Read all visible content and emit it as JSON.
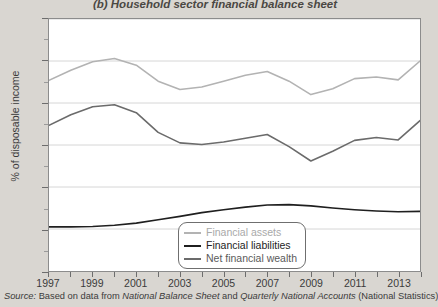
{
  "title": "(b) Household sector financial balance sheet",
  "axes": {
    "ylabel": "% of disposable income",
    "y_ticks": [
      0,
      100,
      200,
      300,
      400,
      500,
      600
    ],
    "y_minor_ticks": [
      50,
      150,
      250,
      350,
      450,
      550
    ],
    "x_ticks": [
      1997,
      1998,
      1999,
      2000,
      2001,
      2002,
      2003,
      2004,
      2005,
      2006,
      2007,
      2008,
      2009,
      2010,
      2011,
      2012,
      2013,
      2014
    ],
    "x_tick_labels": [
      "1997",
      "",
      "1999",
      "",
      "2001",
      "",
      "2003",
      "",
      "2005",
      "",
      "2007",
      "",
      "2009",
      "",
      "2011",
      "",
      "2013",
      ""
    ]
  },
  "legend": {
    "position": "bottom-center",
    "items": [
      {
        "label": "Financial assets",
        "color": "#b3b3b3"
      },
      {
        "label": "Financial liabilities",
        "color": "#1f1f1f"
      },
      {
        "label": "Net financial wealth",
        "color": "#6b6b6b"
      }
    ]
  },
  "source": {
    "lead": "Source:",
    "text_1": " Based on data from ",
    "italic_1": "National Balance Sheet",
    "text_2": " and ",
    "italic_2": "Quarterly National Accounts",
    "text_3": " (National Statistics)"
  },
  "colors": {
    "page_background": "#d9d6d1",
    "plot_background": "#ffffff",
    "gridline": "#d6d6d6",
    "axis": "#8c8c8c",
    "text": "#3b3b3b"
  },
  "chart_data": {
    "type": "line",
    "title": "(b) Household sector financial balance sheet",
    "xlabel": "",
    "ylabel": "% of disposable income",
    "xlim": [
      1997,
      2014
    ],
    "ylim": [
      0,
      600
    ],
    "grid": true,
    "legend_position": "bottom-center",
    "x": [
      1997,
      1998,
      1999,
      2000,
      2001,
      2002,
      2003,
      2004,
      2005,
      2006,
      2007,
      2008,
      2009,
      2010,
      2011,
      2012,
      2013,
      2014
    ],
    "series": [
      {
        "name": "Financial assets",
        "color": "#b3b3b3",
        "values": [
          454,
          478,
          498,
          506,
          490,
          452,
          432,
          438,
          452,
          466,
          475,
          452,
          420,
          434,
          458,
          462,
          455,
          500
        ]
      },
      {
        "name": "Financial liabilities",
        "color": "#1f1f1f",
        "values": [
          105,
          105,
          106,
          109,
          114,
          122,
          130,
          139,
          146,
          152,
          157,
          158,
          155,
          150,
          146,
          143,
          141,
          142
        ]
      },
      {
        "name": "Net financial wealth",
        "color": "#6b6b6b",
        "values": [
          347,
          372,
          391,
          396,
          377,
          330,
          305,
          301,
          307,
          316,
          325,
          296,
          262,
          285,
          311,
          318,
          312,
          358
        ]
      }
    ]
  }
}
